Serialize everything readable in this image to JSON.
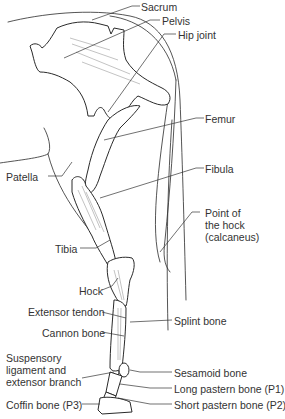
{
  "diagram": {
    "colors": {
      "line": "#2a2a2a",
      "bone_fill": "#ffffff",
      "shade": "#9a9a9a",
      "text": "#333333"
    },
    "labels": {
      "sacrum": "Sacrum",
      "pelvis": "Pelvis",
      "hip_joint": "Hip joint",
      "femur": "Femur",
      "patella": "Patella",
      "fibula": "Fibula",
      "point_of_hock": "Point of\nthe hock\n(calcaneus)",
      "tibia": "Tibia",
      "hock": "Hock",
      "extensor_tendon": "Extensor tendon",
      "splint_bone": "Splint bone",
      "cannon_bone": "Cannon bone",
      "suspensory": "Suspensory\nligament and\nextensor branch",
      "sesamoid_bone": "Sesamoid bone",
      "long_pastern": "Long pastern bone (P1)",
      "coffin_bone": "Coffin bone (P3)",
      "short_pastern": "Short pastern bone (P2)"
    }
  }
}
